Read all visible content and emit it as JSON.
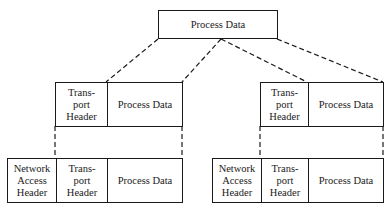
{
  "diagram": {
    "top": {
      "label": "Process Data"
    },
    "middle_left": {
      "transport_header": "Trans-\nport\nHeader",
      "process_data": "Process Data"
    },
    "middle_right": {
      "transport_header": "Trans-\nport\nHeader",
      "process_data": "Process Data"
    },
    "bottom_left": {
      "network_access_header": "Network\nAccess\nHeader",
      "transport_header": "Trans-\nport\nHeader",
      "process_data": "Process Data"
    },
    "bottom_right": {
      "network_access_header": "Network\nAccess\nHeader",
      "transport_header": "Trans-\nport\nHeader",
      "process_data": "Process Data"
    },
    "line_color": "#1a1a1a"
  }
}
